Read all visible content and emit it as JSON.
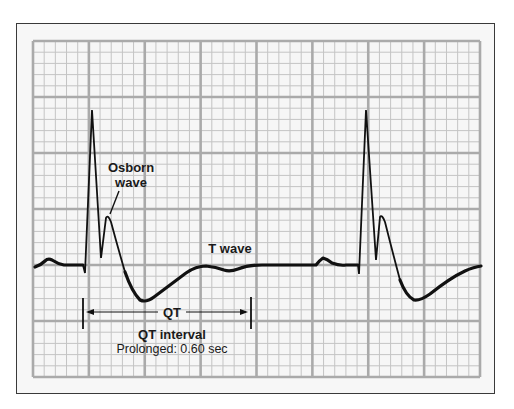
{
  "diagram": {
    "type": "ecg-strip",
    "grid": {
      "major_columns": 8,
      "major_rows": 6,
      "minor_per_major": 5,
      "background_color": "#f6f6f6",
      "major_line_color": "#aaaaaa",
      "minor_line_color": "#c4c4c4"
    },
    "trace_color": "#111111",
    "labels": {
      "osborn_line1": "Osborn",
      "osborn_line2": "wave",
      "t_wave": "T wave",
      "qt_short": "QT",
      "qt_interval": "QT interval",
      "qt_prolonged": "Prolonged: 0.60 sec"
    },
    "beats": [
      {
        "name": "beat-1",
        "components": [
          "P wave",
          "QRS complex",
          "Osborn wave",
          "T wave"
        ]
      },
      {
        "name": "beat-2",
        "components": [
          "P wave",
          "QRS complex",
          "Osborn wave",
          "T wave"
        ]
      }
    ],
    "measurement": {
      "label": "QT interval",
      "value": "0.60 sec",
      "status": "Prolonged"
    }
  }
}
